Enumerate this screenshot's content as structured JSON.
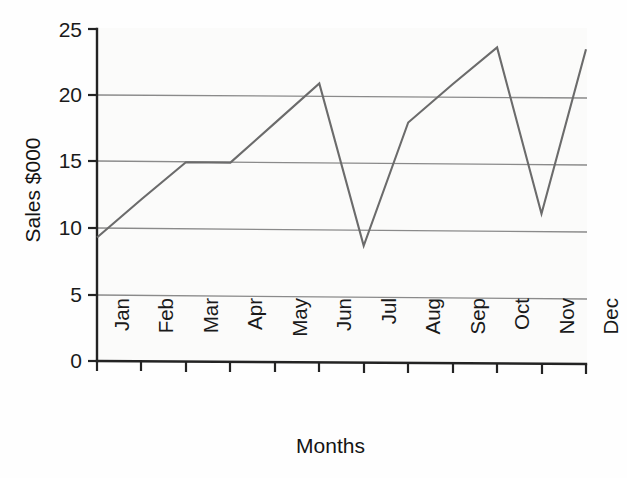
{
  "chart_data": {
    "type": "line",
    "title": "",
    "xlabel": "Months",
    "ylabel": "Sales $000",
    "categories": [
      "Jan",
      "Feb",
      "Mar",
      "Apr",
      "May",
      "Jun",
      "Jul",
      "Aug",
      "Sep",
      "Oct",
      "Nov",
      "Dec"
    ],
    "values": [
      9.3,
      12.2,
      15.0,
      15.0,
      18.0,
      21.0,
      8.8,
      18.1,
      21.0,
      23.8,
      11.3,
      23.7
    ],
    "series": [
      {
        "name": "Sales",
        "values": [
          9.3,
          12.2,
          15.0,
          15.0,
          18.0,
          21.0,
          8.8,
          18.1,
          21.0,
          23.8,
          11.3,
          23.7
        ]
      }
    ],
    "ylim": [
      0,
      25
    ],
    "yticks": [
      0,
      5,
      10,
      15,
      20,
      25
    ],
    "ytick_labels": [
      "0",
      "5",
      "10",
      "15",
      "20",
      "25"
    ],
    "xtick_labels": [
      "Jan",
      "Feb",
      "Mar",
      "Apr",
      "May",
      "Jun",
      "Jul",
      "Aug",
      "Sep",
      "Oct",
      "Nov",
      "Dec"
    ],
    "grid": true,
    "gridlines_at": [
      5,
      10,
      15,
      20
    ],
    "legend": "none",
    "legend_position": "none",
    "line_color": "#6b6b6b",
    "axis_color": "#222222",
    "grid_color": "#888888",
    "background_color": "#fbfbfa",
    "markers": false,
    "annotations": []
  },
  "axes": {
    "y_title": "Sales $000",
    "x_title": "Months"
  }
}
